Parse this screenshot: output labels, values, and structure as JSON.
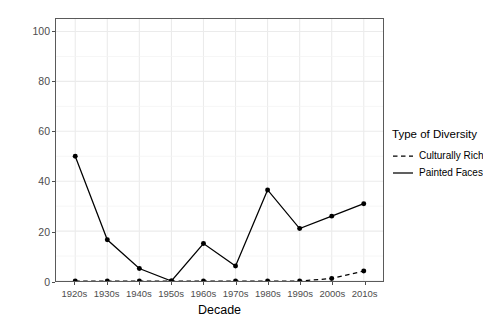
{
  "chart_data": {
    "type": "line",
    "title": "",
    "xlabel": "Decade",
    "ylabel": "Percentage of Books",
    "categories": [
      "1920s",
      "1930s",
      "1940s",
      "1950s",
      "1960s",
      "1970s",
      "1980s",
      "1990s",
      "2000s",
      "2010s"
    ],
    "series": [
      {
        "name": "Culturally Rich",
        "style": "dashed",
        "color": "#000000",
        "values": [
          0,
          0,
          0,
          0,
          0,
          0,
          0,
          0,
          1,
          4
        ]
      },
      {
        "name": "Painted Faces",
        "style": "solid",
        "color": "#000000",
        "values": [
          50,
          16.5,
          5,
          0,
          15,
          6,
          36.5,
          21,
          26,
          31
        ]
      }
    ],
    "ylim": [
      0,
      105
    ],
    "yticks": [
      0,
      20,
      40,
      60,
      80,
      100
    ],
    "ytick_labels": [
      "0",
      "20",
      "40",
      "60",
      "80",
      "100"
    ],
    "grid": true,
    "legend_position": "right"
  },
  "legend": {
    "title": "Type of Diversity",
    "items": [
      {
        "label": "Culturally Rich",
        "style": "dashed"
      },
      {
        "label": "Painted Faces",
        "style": "solid"
      }
    ]
  },
  "axes": {
    "x_title": "Decade",
    "y_title": "Percentage of Books"
  }
}
